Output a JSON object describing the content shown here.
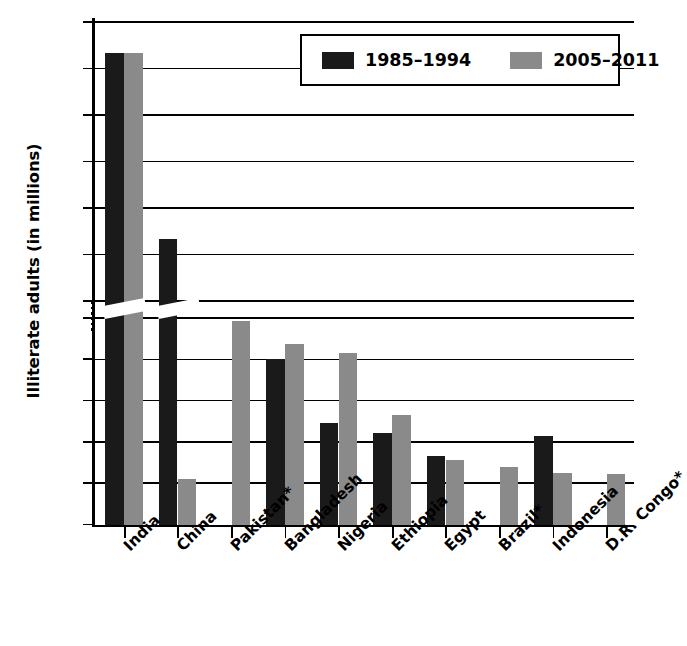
{
  "chart_data": {
    "type": "bar",
    "title": "",
    "xlabel": "",
    "ylabel": "Illiterate adults (in millions)",
    "grid": true,
    "legend_position": "top-right",
    "axis_break": {
      "present": true,
      "below": 50,
      "above": 150
    },
    "y_ticks_lower": [
      0,
      10,
      20,
      30,
      40,
      50
    ],
    "y_ticks_upper": [
      150,
      175,
      200,
      225,
      250,
      275,
      300
    ],
    "ylim_lower": [
      0,
      50
    ],
    "ylim_upper": [
      150,
      300
    ],
    "categories": [
      "India",
      "China",
      "Pakistan*",
      "Bangladesh",
      "Nigeria",
      "Ethiopia",
      "Egypt",
      "Brazil*",
      "Indonesia",
      "D.R. Congo*"
    ],
    "series": [
      {
        "name": "1985–1994",
        "color": "#1a1a1a",
        "values": [
          282,
          182,
          null,
          39.5,
          24,
          21.5,
          16,
          null,
          20.8,
          null
        ]
      },
      {
        "name": "2005–2011",
        "color": "#8a8a8a",
        "values": [
          282,
          53,
          48.7,
          43,
          41,
          26,
          15,
          13.4,
          11.8,
          11.7
        ]
      }
    ],
    "footnote": "* asterisk marks countries flagged in the source"
  },
  "axis": {
    "y_title": "Illiterate adults (in millions)",
    "y_tick_labels": [
      "300",
      "275",
      "250",
      "225",
      "200",
      "175",
      "150",
      "50",
      "40",
      "30",
      "20",
      "10",
      "0"
    ]
  },
  "legend": {
    "items": [
      {
        "label": "1985–1994",
        "color": "#1a1a1a",
        "swatch": "legend-swatch-black"
      },
      {
        "label": "2005–2011",
        "color": "#8a8a8a",
        "swatch": "legend-swatch-gray"
      }
    ]
  }
}
